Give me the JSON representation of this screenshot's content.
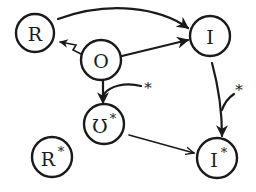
{
  "diagram": {
    "type": "state-transition-diagram",
    "nodes": [
      {
        "id": "R",
        "label": "R",
        "superscript": ""
      },
      {
        "id": "O",
        "label": "O",
        "superscript": ""
      },
      {
        "id": "I",
        "label": "I",
        "superscript": ""
      },
      {
        "id": "Ostar",
        "label": "Ʊ",
        "superscript": "*"
      },
      {
        "id": "Rstar",
        "label": "R",
        "superscript": "*"
      },
      {
        "id": "Istar",
        "label": "I",
        "superscript": "*"
      }
    ],
    "edges": [
      {
        "from": "R",
        "to": "I",
        "style": "curved-over-top",
        "label": ""
      },
      {
        "from": "O",
        "to": "R",
        "style": "zigzag",
        "label": ""
      },
      {
        "from": "O",
        "to": "I",
        "style": "straight",
        "label": ""
      },
      {
        "from": "O",
        "to": "Ostar",
        "style": "straight",
        "label": ""
      },
      {
        "from": "I",
        "to": "Istar",
        "style": "curved",
        "label": ""
      },
      {
        "from": "Ostar",
        "to": "Istar",
        "style": "straight-open-arrow",
        "label": ""
      }
    ],
    "modifiers": [
      {
        "target_edge": "O->Ostar",
        "label": "*"
      },
      {
        "target_edge": "I->Istar",
        "label": "*"
      }
    ],
    "colors": {
      "ink": "#1a1a1a",
      "background": "#ffffff"
    }
  }
}
